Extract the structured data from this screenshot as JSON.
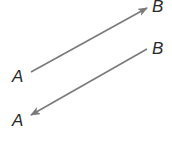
{
  "diagram": {
    "arrows": [
      {
        "id": "arrow-a-to-b",
        "from_label": "A",
        "to_label": "B",
        "direction": "A to B",
        "start": [
          31,
          72
        ],
        "end": [
          147,
          8
        ]
      },
      {
        "id": "arrow-b-to-a",
        "from_label": "B",
        "to_label": "A",
        "direction": "B to A",
        "start": [
          147,
          49
        ],
        "end": [
          31,
          115
        ]
      }
    ],
    "labels": {
      "top_b": "B",
      "top_a": "A",
      "bottom_b": "B",
      "bottom_a": "A"
    },
    "colors": {
      "line": "#7a7a7a",
      "text": "#2a2a2a",
      "background": "#ffffff"
    }
  }
}
